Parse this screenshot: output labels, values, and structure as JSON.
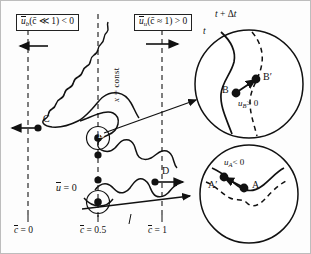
{
  "figure": {
    "axis_note": "x = const",
    "mean_velocity_zero": "ū = 0"
  },
  "labels": {
    "box_burnt": {
      "var": "ū",
      "sub": "b",
      "cond": "(c̄ ≪ 1) < 0",
      "full": "ū_b(c̄ ≪ 1) < 0"
    },
    "box_unburnt": {
      "var": "ū",
      "sub": "u",
      "cond": "(c̄ ≈ 1) > 0",
      "full": "ū_u(c̄ ≈ 1) > 0"
    },
    "vertical_line_label": "x = const",
    "mean_u_zero": {
      "var": "ū",
      "rest": "= 0"
    },
    "points": {
      "C": "C",
      "B": "B",
      "B_prime": "B′",
      "A": "A",
      "A_prime": "A′",
      "D": "D"
    },
    "time_now": "t",
    "time_next": "t + Δt",
    "u_B": {
      "var": "u",
      "sub": "B",
      "rest": "> 0",
      "full": "u_B > 0"
    },
    "u_A": {
      "var": "u",
      "sub": "A",
      "rest": "< 0",
      "full": "u_A < 0"
    }
  },
  "axis_ticks": [
    {
      "id": "c0",
      "var": "c̄",
      "value": "= 0",
      "full": "c̄ = 0",
      "x_px": 28
    },
    {
      "id": "c05",
      "var": "c̄",
      "value": "= 0.5",
      "full": "c̄ = 0.5",
      "x_px": 98
    },
    {
      "id": "c1",
      "var": "c̄",
      "value": "= 1",
      "full": "c̄ = 1",
      "x_px": 162
    }
  ],
  "arrows": {
    "burnt_side": {
      "direction": "left",
      "label": "mean velocity in burnt gas"
    },
    "unburnt_side": {
      "direction": "right",
      "label": "mean velocity in unburnt gas"
    },
    "point_C": {
      "direction": "left"
    },
    "point_D": {
      "direction": "right"
    },
    "callout_upper": {
      "from": "B",
      "to": "upper-magnifier"
    },
    "callout_lower": {
      "from": "A",
      "to": "lower-magnifier"
    }
  },
  "colors": {
    "ink": "#111111",
    "dash": "#3a3a3a",
    "paper": "#fdfdfd",
    "marker": "#111111"
  }
}
